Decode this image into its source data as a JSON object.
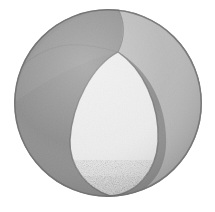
{
  "image": {
    "title": "Sphere divided into three lune segments",
    "subject": "sphere",
    "style": "grayscale halftone engraving",
    "background_color": "#ffffff",
    "canvas": {
      "width": 215,
      "height": 212
    }
  },
  "sphere": {
    "center_x": 108,
    "center_y": 103,
    "radius_x": 94,
    "radius_y": 94,
    "outline_color": "#6f6f6f",
    "pole_x": 118,
    "pole_y": 52
  },
  "segments": [
    {
      "id": "segment-dark-left",
      "label": "Dark left lune",
      "fill_color": "#8a8a8a",
      "tone": "dark gray",
      "position": "upper-left and left"
    },
    {
      "id": "segment-mid-right",
      "label": "Medium right lune",
      "fill_color": "#bdbdbd",
      "tone": "medium light gray",
      "position": "right"
    },
    {
      "id": "segment-light-front",
      "label": "Light front teardrop lune",
      "fill_color": "#ededed",
      "tone": "near white",
      "position": "front center"
    },
    {
      "id": "segment-dark-top",
      "label": "Dark top cap wedge",
      "fill_color": "#8f8f8f",
      "tone": "dark gray",
      "position": "top"
    }
  ],
  "meridians": [
    {
      "id": "meridian-left",
      "label": "Left meridian arc",
      "stroke_color": "#6a6a6a"
    },
    {
      "id": "meridian-right",
      "label": "Right meridian arc",
      "stroke_color": "#6a6a6a"
    },
    {
      "id": "meridian-back",
      "label": "Back meridian arc",
      "stroke_color": "#767676"
    }
  ],
  "texture": {
    "speckle_color": "#9a9a9a",
    "speckle_region": "bottom of light front lune",
    "grain_opacity": 0.18
  }
}
